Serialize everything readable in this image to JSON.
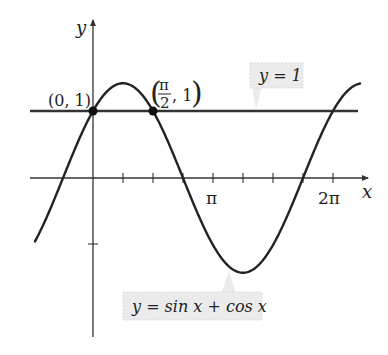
{
  "figure": {
    "type": "function-graph",
    "function_label": "y = sin x + cos x",
    "axes": {
      "x_label": "x",
      "y_label": "y",
      "x_tick_labels": [
        "π",
        "2π"
      ],
      "x_tick_step": "π/4",
      "y_ticks": [
        1,
        -1
      ]
    },
    "horizontal_line": {
      "label": "y = 1",
      "y": 1
    },
    "points": [
      {
        "label": "(0, 1)",
        "x": 0,
        "y": 1
      },
      {
        "label_num": "π",
        "label_den": "2",
        "label_rest": ", 1",
        "x": "π/2",
        "y": 1
      }
    ],
    "colors": {
      "curve": "#222222",
      "axes": "#333333",
      "line": "#333333",
      "callout_bg": "#ebebeb"
    }
  },
  "chart_data": {
    "type": "line",
    "title": "",
    "xlabel": "x",
    "ylabel": "y",
    "series": [
      {
        "name": "y = sin x + cos x",
        "x": [
          -1.2566,
          -0.7854,
          0,
          0.7854,
          1.5708,
          2.3562,
          3.1416,
          3.927,
          4.7124,
          5.4978,
          6.2832,
          7.0686
        ],
        "values": [
          -0.642,
          0,
          1,
          1.414,
          1,
          0,
          -1,
          -1.414,
          -1,
          0,
          1,
          1.414
        ]
      },
      {
        "name": "y = 1",
        "x": [
          -1.57,
          7.0
        ],
        "values": [
          1,
          1
        ]
      }
    ],
    "annotations": [
      "(0, 1)",
      "(π/2, 1)",
      "y = 1",
      "y = sin x + cos x"
    ],
    "x_tick_labels": [
      "π",
      "2π"
    ],
    "xlim": [
      -1.6,
      7.3
    ],
    "ylim": [
      -2.4,
      2.4
    ],
    "grid": false
  }
}
